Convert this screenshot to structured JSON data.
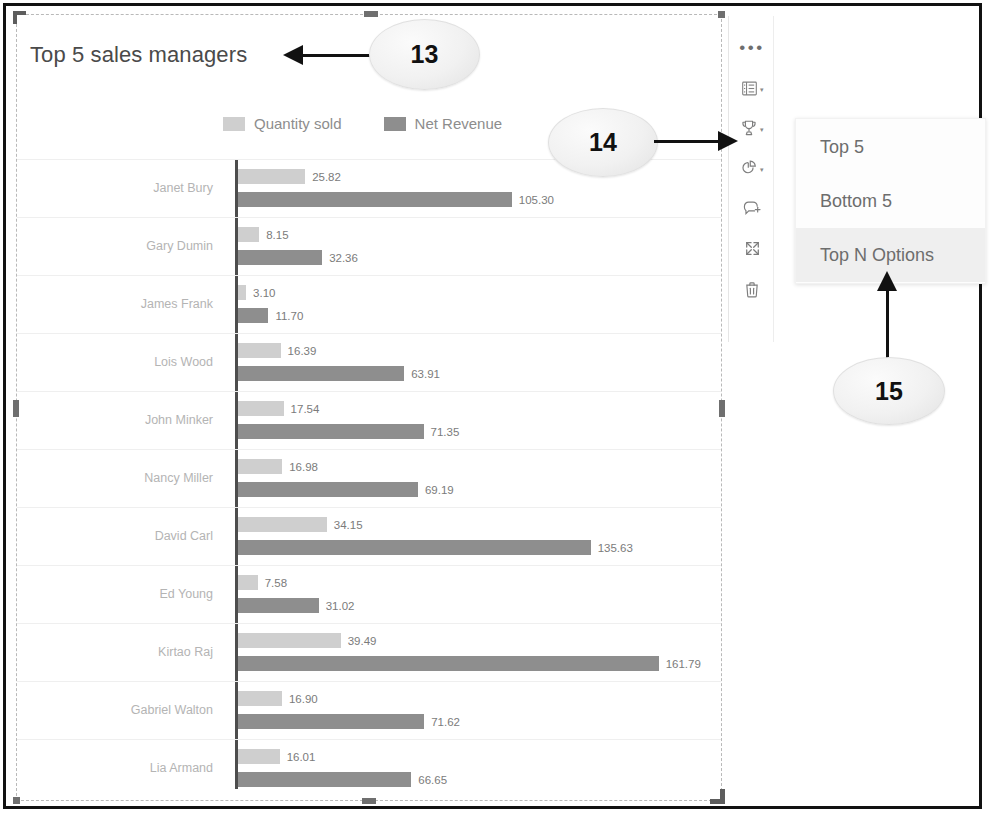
{
  "page": {
    "title": "Top 5 sales managers"
  },
  "legend": [
    {
      "label": "Quantity sold",
      "color": "#cfcfcf"
    },
    {
      "label": "Net Revenue",
      "color": "#8e8e8e"
    }
  ],
  "toolbar": {
    "more_label": "•••",
    "items": [
      {
        "name": "more-options-icon",
        "label": "More options"
      },
      {
        "name": "list-view-icon",
        "label": "Show as table"
      },
      {
        "name": "trophy-icon",
        "label": "Top N"
      },
      {
        "name": "pie-chart-icon",
        "label": "Chart type"
      },
      {
        "name": "comment-add-icon",
        "label": "Add comment"
      },
      {
        "name": "expand-icon",
        "label": "Maximize"
      },
      {
        "name": "trash-icon",
        "label": "Delete"
      }
    ],
    "caret": "▾"
  },
  "menu": {
    "items": [
      {
        "label": "Top 5",
        "highlighted": false
      },
      {
        "label": "Bottom 5",
        "highlighted": false
      },
      {
        "label": "Top N Options",
        "highlighted": true
      }
    ]
  },
  "callouts": [
    {
      "id": "13",
      "label": "13"
    },
    {
      "id": "14",
      "label": "14"
    },
    {
      "id": "15",
      "label": "15"
    }
  ],
  "chart_data": {
    "type": "bar",
    "orientation": "horizontal",
    "title": "Top 5 sales managers",
    "xlabel": "",
    "ylabel": "",
    "grid": false,
    "legend_position": "top",
    "xlim": [
      0,
      175
    ],
    "categories": [
      "Janet Bury",
      "Gary Dumin",
      "James Frank",
      "Lois Wood",
      "John Minker",
      "Nancy Miller",
      "David Carl",
      "Ed Young",
      "Kirtao Raj",
      "Gabriel Walton",
      "Lia Armand"
    ],
    "series": [
      {
        "name": "Quantity sold",
        "color": "#cfcfcf",
        "values": [
          25.82,
          8.15,
          3.1,
          16.39,
          17.54,
          16.98,
          34.15,
          7.58,
          39.49,
          16.9,
          16.01
        ],
        "labels": [
          "25.82",
          "8.15",
          "3.10",
          "16.39",
          "17.54",
          "16.98",
          "34.15",
          "7.58",
          "39.49",
          "16.90",
          "16.01"
        ]
      },
      {
        "name": "Net Revenue",
        "color": "#8e8e8e",
        "values": [
          105.3,
          32.36,
          11.7,
          63.91,
          71.35,
          69.19,
          135.63,
          31.02,
          161.79,
          71.62,
          66.65
        ],
        "labels": [
          "105.30",
          "32.36",
          "11.70",
          "63.91",
          "71.35",
          "69.19",
          "135.63",
          "31.02",
          "161.79",
          "71.62",
          "66.65"
        ]
      }
    ]
  }
}
